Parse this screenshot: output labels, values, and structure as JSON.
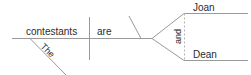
{
  "diagram": {
    "type": "reed-kellogg-sentence-diagram",
    "sentence": "The contestants are Joan and Dean.",
    "colors": {
      "background": "#ffffff",
      "line": "#9a9a9a",
      "line_dashed": "#b4b4b4",
      "text": "#2b2b2b"
    },
    "words": {
      "subject": "contestants",
      "subject_modifier": "The",
      "verb": "are",
      "complement_first": "Joan",
      "conjunction": "and",
      "complement_second": "Dean"
    },
    "labels": {
      "subject_line": "subject-baseline",
      "verb_line": "verb-baseline",
      "subject_verb_divider": "subject-verb-divider",
      "complement_divider": "predicate-nominative-divider",
      "modifier_line": "article-modifier-slant",
      "fork_upper": "compound-branch-upper",
      "fork_lower": "compound-branch-lower",
      "conjunction_line": "conjunction-dashed-connector"
    }
  }
}
